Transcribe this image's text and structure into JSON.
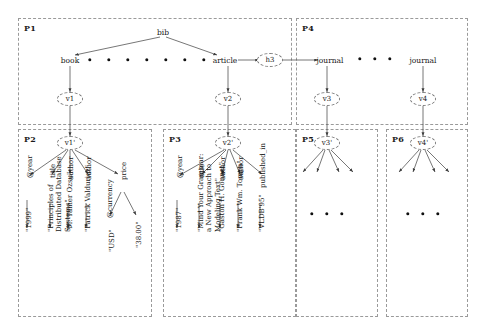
{
  "figure": {
    "type": "xml-bibliography-tree-diagram",
    "top_clipped_text": ""
  },
  "panels": [
    {
      "id": "P1",
      "label": "P1",
      "x": 18,
      "y": 18,
      "w": 274,
      "h": 107
    },
    {
      "id": "P4",
      "label": "P4",
      "x": 296,
      "y": 18,
      "w": 172,
      "h": 107
    },
    {
      "id": "P2",
      "label": "P2",
      "x": 18,
      "y": 129,
      "w": 134,
      "h": 188
    },
    {
      "id": "P3",
      "label": "P3",
      "x": 163,
      "y": 129,
      "w": 133,
      "h": 188
    },
    {
      "id": "P5",
      "label": "P5",
      "x": 296,
      "y": 129,
      "w": 82,
      "h": 188
    },
    {
      "id": "P6",
      "label": "P6",
      "x": 386,
      "y": 129,
      "w": 82,
      "h": 188
    }
  ],
  "nodes": {
    "bib": "bib",
    "book": "book",
    "article": "article",
    "h3": "h3",
    "journal_left": "journal",
    "journal_right": "journal",
    "v1": "v1",
    "v2": "v2",
    "v3": "v3",
    "v4": "v4",
    "v1_prime": "v1'",
    "v2_prime": "v2'",
    "v3_prime": "v3'",
    "v4_prime": "v4'"
  },
  "p2_book": {
    "edges": [
      "@year",
      "title",
      "author",
      "author",
      "price"
    ],
    "values": {
      "year": "\"1999\"",
      "title": "\"Principles of Distributed Database Systems\"",
      "author1": "\"M. Tamer Ozsu\"",
      "author2": "\"Patrick Valduriez\"",
      "currency_label": "@currency",
      "currency_value": "\"USD\"",
      "price_value": "\"38.00\""
    }
  },
  "p3_article": {
    "edges": [
      "@year",
      "title",
      "author",
      "author",
      "published_in"
    ],
    "values": {
      "year": "\"1987\"",
      "title": "\"Mind Your Grammar: a New Approach to Modeling Text\"",
      "author1": "\"Gaston H. Gonnet\"",
      "author2": "\"Frank Wm. Tompa\"",
      "published_in": "\"VLDB'95\""
    }
  },
  "ellipsis": {
    "bib_children_dots": 7,
    "journal_dots": 3,
    "p5_dots": 3,
    "p6_dots": 3
  },
  "colors": {
    "panel_border": "#9a9a9a",
    "node_border": "#7d7d7d",
    "edge": "#4a4a4a",
    "text": "#151515"
  }
}
